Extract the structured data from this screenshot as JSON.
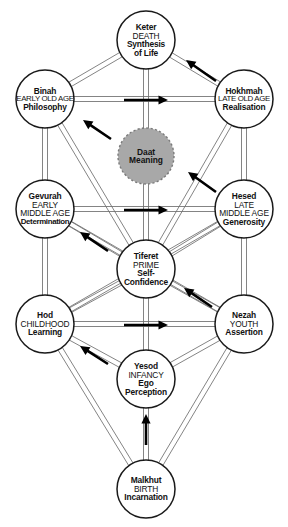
{
  "diagram": {
    "background_color": "#ffffff",
    "line_color": "#6e6e6e",
    "node_stroke_color": "#1a1a1a",
    "node_fill_color": "#ffffff",
    "daat_fill_color": "#a8a8a8",
    "arrow_color": "#000000"
  },
  "nodes": [
    {
      "id": "keter",
      "name": "Keter",
      "stage": "DEATH",
      "quality_line1": "Synthesis",
      "quality_line2": "of Life",
      "cx": 146,
      "cy": 40,
      "r": 29,
      "type": "sefirah"
    },
    {
      "id": "binah",
      "name": "Binah",
      "stage": "EARLY OLD AGE",
      "quality_line1": "Philosophy",
      "quality_line2": "",
      "cx": 45,
      "cy": 99,
      "r": 29,
      "type": "sefirah"
    },
    {
      "id": "hokhmah",
      "name": "Hokhmah",
      "stage": "LATE OLD AGE",
      "quality_line1": "Realisation",
      "quality_line2": "",
      "cx": 244,
      "cy": 99,
      "r": 29,
      "type": "sefirah"
    },
    {
      "id": "daat",
      "name": "Daat",
      "stage": "",
      "quality_line1": "Meaning",
      "quality_line2": "",
      "cx": 146,
      "cy": 156,
      "r": 28,
      "type": "daat"
    },
    {
      "id": "gevurah",
      "name": "Gevurah",
      "stage": "EARLY",
      "stage2": "MIDDLE AGE",
      "quality_line1": "Determination",
      "quality_line2": "",
      "cx": 45,
      "cy": 209,
      "r": 29,
      "type": "sefirah"
    },
    {
      "id": "hesed",
      "name": "Hesed",
      "stage": "LATE",
      "stage2": "MIDDLE AGE",
      "quality_line1": "Generosity",
      "quality_line2": "",
      "cx": 244,
      "cy": 209,
      "r": 29,
      "type": "sefirah"
    },
    {
      "id": "tiferet",
      "name": "Tiferet",
      "stage": "PRIME",
      "quality_line1": "Self-",
      "quality_line2": "Confidence",
      "cx": 146,
      "cy": 269,
      "r": 29,
      "type": "sefirah"
    },
    {
      "id": "hod",
      "name": "Hod",
      "stage": "CHILDHOOD",
      "quality_line1": "Learning",
      "quality_line2": "",
      "cx": 45,
      "cy": 324,
      "r": 29,
      "type": "sefirah"
    },
    {
      "id": "nezah",
      "name": "Nezah",
      "stage": "YOUTH",
      "quality_line1": "Assertion",
      "quality_line2": "",
      "cx": 244,
      "cy": 324,
      "r": 29,
      "type": "sefirah"
    },
    {
      "id": "yesod",
      "name": "Yesod",
      "stage": "INFANCY",
      "quality_line1": "Ego",
      "quality_line2": "Perception",
      "cx": 146,
      "cy": 379,
      "r": 29,
      "type": "sefirah"
    },
    {
      "id": "malkhut",
      "name": "Malkhut",
      "stage": "BIRTH",
      "quality_line1": "Incarnation",
      "quality_line2": "",
      "cx": 146,
      "cy": 489,
      "r": 29,
      "type": "sefirah"
    }
  ],
  "paths": [
    {
      "from": "binah",
      "to": "hokhmah",
      "kind": "horizontal-pair"
    },
    {
      "from": "gevurah",
      "to": "hesed",
      "kind": "horizontal-pair"
    },
    {
      "from": "hod",
      "to": "nezah",
      "kind": "horizontal-pair"
    },
    {
      "from": "keter",
      "to": "binah",
      "kind": "diagonal-pair"
    },
    {
      "from": "keter",
      "to": "hokhmah",
      "kind": "diagonal-pair"
    },
    {
      "from": "keter",
      "to": "tiferet",
      "kind": "vertical-pair"
    },
    {
      "from": "binah",
      "to": "gevurah",
      "kind": "vertical-pair"
    },
    {
      "from": "hokhmah",
      "to": "hesed",
      "kind": "vertical-pair"
    },
    {
      "from": "binah",
      "to": "tiferet",
      "kind": "diagonal-pair"
    },
    {
      "from": "hokhmah",
      "to": "tiferet",
      "kind": "diagonal-pair"
    },
    {
      "from": "gevurah",
      "to": "tiferet",
      "kind": "diagonal-pair"
    },
    {
      "from": "hesed",
      "to": "tiferet",
      "kind": "diagonal-pair"
    },
    {
      "from": "gevurah",
      "to": "hod",
      "kind": "vertical-pair"
    },
    {
      "from": "hesed",
      "to": "nezah",
      "kind": "vertical-pair"
    },
    {
      "from": "gevurah",
      "to": "nezah",
      "kind": "diagonal-pair"
    },
    {
      "from": "hesed",
      "to": "hod",
      "kind": "diagonal-pair"
    },
    {
      "from": "tiferet",
      "to": "hod",
      "kind": "diagonal-pair"
    },
    {
      "from": "tiferet",
      "to": "nezah",
      "kind": "diagonal-pair"
    },
    {
      "from": "tiferet",
      "to": "yesod",
      "kind": "vertical-pair"
    },
    {
      "from": "hod",
      "to": "yesod",
      "kind": "diagonal-pair"
    },
    {
      "from": "nezah",
      "to": "yesod",
      "kind": "diagonal-pair"
    },
    {
      "from": "hod",
      "to": "malkhut",
      "kind": "diagonal-pair"
    },
    {
      "from": "nezah",
      "to": "malkhut",
      "kind": "diagonal-pair"
    },
    {
      "from": "yesod",
      "to": "malkhut",
      "kind": "vertical-pair"
    }
  ],
  "arrows": [
    {
      "id": "arrow-binah-to-hokhmah",
      "direction": "right",
      "x1": 124,
      "y1": 100,
      "x2": 168,
      "y2": 100
    },
    {
      "id": "arrow-gevurah-to-hesed",
      "direction": "right",
      "x1": 124,
      "y1": 210,
      "x2": 168,
      "y2": 210
    },
    {
      "id": "arrow-hod-to-nezah",
      "direction": "right",
      "x1": 124,
      "y1": 325,
      "x2": 168,
      "y2": 325
    },
    {
      "id": "arrow-hokhmah-to-keter",
      "direction": "up-left",
      "x1": 216,
      "y1": 81,
      "x2": 186,
      "y2": 60
    },
    {
      "id": "arrow-daat-to-binah",
      "direction": "up-left",
      "x1": 111,
      "y1": 139,
      "x2": 83,
      "y2": 120
    },
    {
      "id": "arrow-hesed-to-daat",
      "direction": "up-left",
      "x1": 216,
      "y1": 192,
      "x2": 188,
      "y2": 172
    },
    {
      "id": "arrow-tiferet-to-gevurah",
      "direction": "up-left",
      "x1": 108,
      "y1": 251,
      "x2": 80,
      "y2": 232
    },
    {
      "id": "arrow-nezah-to-tiferet",
      "direction": "up-left",
      "x1": 212,
      "y1": 307,
      "x2": 184,
      "y2": 288
    },
    {
      "id": "arrow-yesod-to-hod",
      "direction": "up-left",
      "x1": 108,
      "y1": 364,
      "x2": 80,
      "y2": 346
    },
    {
      "id": "arrow-malkhut-to-yesod",
      "direction": "up",
      "x1": 146,
      "y1": 445,
      "x2": 146,
      "y2": 414
    }
  ]
}
